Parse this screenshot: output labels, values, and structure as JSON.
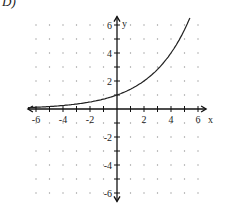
{
  "option_label": "D)",
  "chart_data": {
    "type": "line",
    "title": "",
    "function_description": "exponential growth curve through (0,1), approx y = 2^(x/2)",
    "xlabel": "x",
    "ylabel": "y",
    "xlim": [
      -6.5,
      6.5
    ],
    "ylim": [
      -6.5,
      6.5
    ],
    "grid": "dotted points at integer lattice",
    "x_tick_labels": [
      "-6",
      "-4",
      "-2",
      "2",
      "4",
      "6"
    ],
    "y_tick_labels": [
      "6",
      "4",
      "2",
      "-2",
      "-4",
      "-6"
    ],
    "series": [
      {
        "name": "curve",
        "x": [
          -6.5,
          -6,
          -5,
          -4,
          -3,
          -2,
          -1,
          0,
          1,
          2,
          3,
          4,
          5,
          5.4
        ],
        "y": [
          0.09,
          0.125,
          0.18,
          0.25,
          0.35,
          0.5,
          0.71,
          1,
          1.41,
          2,
          2.83,
          4,
          5.66,
          6.5
        ]
      }
    ]
  }
}
